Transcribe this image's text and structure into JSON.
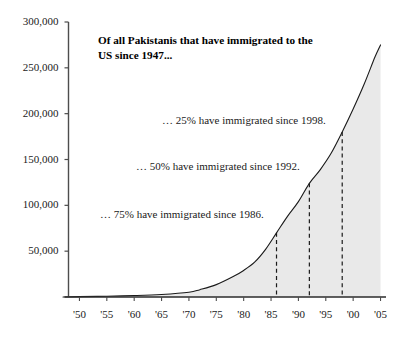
{
  "chart_data": {
    "type": "area",
    "title": "Of all Pakistanis that have immigrated to the US since 1947...",
    "xlabel": "",
    "ylabel": "",
    "xlim": [
      1948,
      2006
    ],
    "ylim": [
      0,
      300000
    ],
    "grid": false,
    "legend": null,
    "fill_color": "#e9e9e9",
    "line_color": "#1a1a1a",
    "x_tick_labels": [
      "'50",
      "'55",
      "'60",
      "'65",
      "'70",
      "'75",
      "'80",
      "'85",
      "'90",
      "'95",
      "'00",
      "'05"
    ],
    "x_tick_values": [
      1950,
      1955,
      1960,
      1965,
      1970,
      1975,
      1980,
      1985,
      1990,
      1995,
      2000,
      2005
    ],
    "y_tick_labels": [
      "50,000",
      "100,000",
      "150,000",
      "200,000",
      "250,000",
      "300,000"
    ],
    "y_tick_values": [
      50000,
      100000,
      150000,
      200000,
      250000,
      300000
    ],
    "series": [
      {
        "name": "Cumulative Pakistani immigration to the US",
        "x": [
          1947,
          1950,
          1955,
          1960,
          1965,
          1970,
          1972,
          1975,
          1978,
          1980,
          1982,
          1984,
          1986,
          1988,
          1990,
          1992,
          1994,
          1996,
          1998,
          2000,
          2002,
          2004,
          2005
        ],
        "values": [
          0,
          400,
          900,
          1600,
          2800,
          5200,
          8000,
          13500,
          22000,
          29000,
          38000,
          52000,
          70000,
          88000,
          104000,
          124000,
          139000,
          157000,
          180000,
          205000,
          232000,
          262000,
          275000
        ]
      }
    ],
    "annotations": [
      {
        "text": "… 25% have immigrated since 1998.",
        "marker_year": 1998,
        "marker_value": 180000
      },
      {
        "text": "… 50% have immigrated since 1992.",
        "marker_year": 1992,
        "marker_value": 124000
      },
      {
        "text": "… 75% have immigrated since 1986.",
        "marker_year": 1986,
        "marker_value": 70000
      }
    ],
    "marker_lines": [
      {
        "year": 1986,
        "value": 70000,
        "style": "dashed"
      },
      {
        "year": 1992,
        "value": 124000,
        "style": "dashed"
      },
      {
        "year": 1998,
        "value": 180000,
        "style": "dashed"
      }
    ]
  }
}
